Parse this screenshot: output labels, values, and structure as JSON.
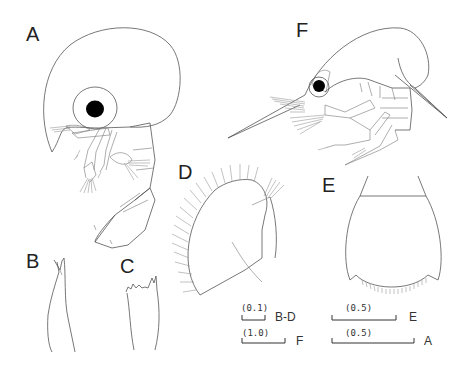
{
  "figure": {
    "panels": [
      {
        "id": "A",
        "label": "A",
        "description": "whole larva, lateral view (large rounded carapace)"
      },
      {
        "id": "B",
        "label": "B",
        "description": "appendage detail, bifid tip"
      },
      {
        "id": "C",
        "label": "C",
        "description": "appendage detail, toothed tip"
      },
      {
        "id": "D",
        "label": "D",
        "description": "plumose-setose appendage"
      },
      {
        "id": "E",
        "label": "E",
        "description": "telson with setose posterior margin"
      },
      {
        "id": "F",
        "label": "F",
        "description": "whole larva, lateral view (elongate rostrum)"
      }
    ],
    "scale_bars": [
      {
        "value": "(0.1)",
        "applies_to": "B-D"
      },
      {
        "value": "(1.0)",
        "applies_to": "F"
      },
      {
        "value": "(0.5)",
        "applies_to": "E"
      },
      {
        "value": "(0.5)",
        "applies_to": "A"
      }
    ]
  }
}
